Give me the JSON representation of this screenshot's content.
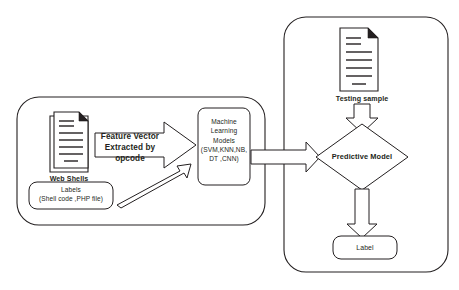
{
  "diagram": {
    "type": "flowchart",
    "stroke_color": "#231f20",
    "background_color": "#ffffff",
    "containers": [
      {
        "id": "training-phase",
        "label": ""
      },
      {
        "id": "testing-phase",
        "label": ""
      }
    ],
    "nodes": {
      "web_shells": {
        "caption": "Web Shells",
        "icon": "stacked-document-icon"
      },
      "labels_box": {
        "line1": "Labels",
        "line2": "(Shell code ,PHP file)",
        "text": "Labels\n(Shell code ,PHP file)"
      },
      "ml_models": {
        "text": "Machine\nLearning\nModels\n(SVM,KNN,NB,\nDT ,CNN)",
        "line1": "Machine",
        "line2": "Learning",
        "line3": "Models",
        "line4": "(SVM,KNN,NB,",
        "line5": "DT ,CNN)"
      },
      "testing_sample": {
        "caption": "Testing sample",
        "icon": "document-icon"
      },
      "predictive_model": {
        "text": "Predictive Model"
      },
      "label_output": {
        "text": "Label"
      }
    },
    "edges": {
      "feature_vector": {
        "line1": "Feature Vector",
        "line2": "Extracted by opcode",
        "text": "Feature Vector\nExtracted by opcode",
        "from": "web_shells",
        "to": "ml_models"
      },
      "labels_to_models": {
        "text": "",
        "from": "labels_box",
        "to": "ml_models"
      },
      "models_to_predictive": {
        "text": "",
        "from": "ml_models",
        "to": "predictive_model"
      },
      "sample_to_predictive": {
        "text": "",
        "from": "testing_sample",
        "to": "predictive_model"
      },
      "predictive_to_label": {
        "text": "",
        "from": "predictive_model",
        "to": "label_output"
      }
    }
  }
}
